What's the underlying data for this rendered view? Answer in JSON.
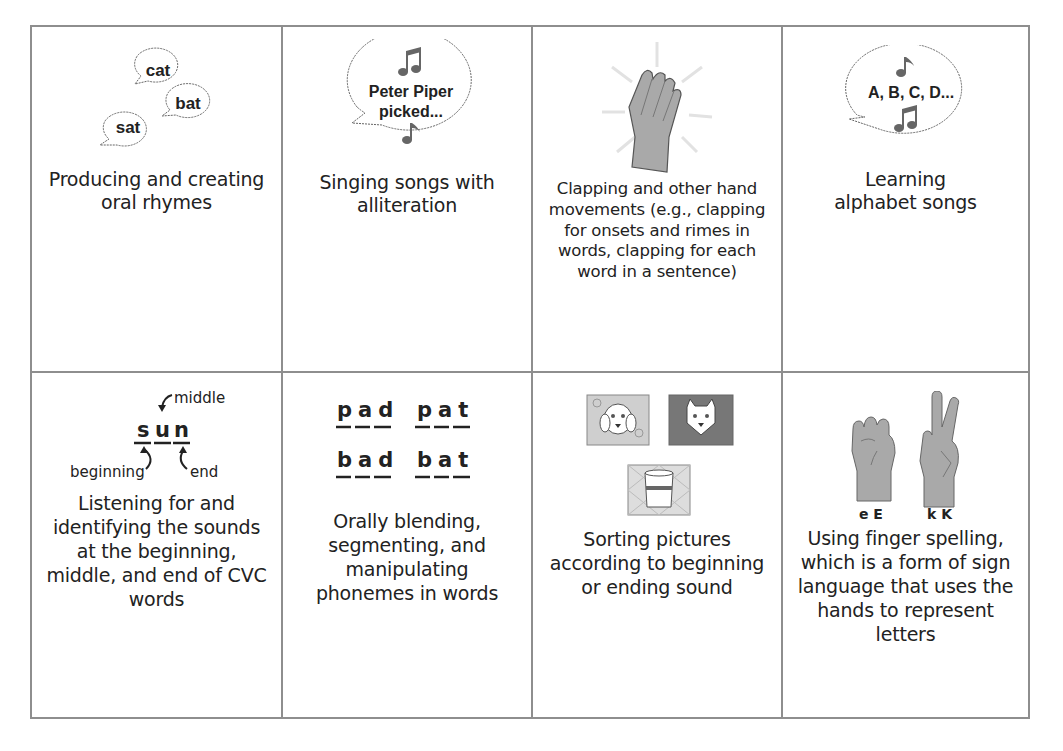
{
  "figure": {
    "rows": [
      {
        "cells": [
          {
            "icon": "rhyme-speech-bubbles-icon",
            "icon_words": [
              "cat",
              "bat",
              "sat"
            ],
            "description": "Producing and creating oral rhymes"
          },
          {
            "icon": "alliteration-song-bubble-icon",
            "icon_text_line1": "Peter Piper",
            "icon_text_line2": "picked...",
            "description": "Singing songs with alliteration"
          },
          {
            "icon": "clapping-hand-icon",
            "description": "Clapping and other hand movements (e.g., clapping for onsets and rimes in words, clapping for each word in a sentence)"
          },
          {
            "icon": "alphabet-song-bubble-icon",
            "icon_text": "A, B, C, D...",
            "description": "Learning alphabet songs"
          }
        ]
      },
      {
        "cells": [
          {
            "icon": "cvc-word-positions-icon",
            "icon_word_letters": [
              "s",
              "u",
              "n"
            ],
            "label_beginning": "beginning",
            "label_middle": "middle",
            "label_end": "end",
            "description": "Listening for and identifying the sounds at the beginning, middle, and end of CVC words"
          },
          {
            "icon": "phoneme-words-icon",
            "words": [
              [
                "pad",
                "pat"
              ],
              [
                "bad",
                "bat"
              ]
            ],
            "description": "Orally blending, segmenting, and manipulating phonemes in words"
          },
          {
            "icon": "picture-sort-cards-icon",
            "pictures": [
              "dog",
              "cat",
              "cup"
            ],
            "description": "Sorting pictures according to beginning or ending sound"
          },
          {
            "icon": "finger-spelling-hands-icon",
            "hand_labels": [
              "e E",
              "k K"
            ],
            "description": "Using finger spelling, which is a form of sign language that uses the hands to represent letters"
          }
        ]
      }
    ]
  },
  "colors": {
    "border": "#8e8e8e",
    "text": "#222222",
    "icon_fill": "#a9a9a9",
    "icon_dark": "#666666"
  }
}
